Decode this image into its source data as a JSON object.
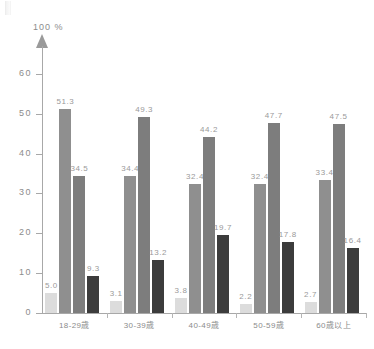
{
  "chart_data": {
    "type": "bar",
    "title": "",
    "subtitle": "",
    "xlabel": "",
    "ylabel": "",
    "axis_unit_label": "100 %",
    "ylim": [
      0,
      67
    ],
    "yticks": [
      0,
      10,
      20,
      30,
      40,
      50,
      60
    ],
    "ytick_labels": [
      "0",
      "10",
      "20",
      "30",
      "40",
      "50",
      "60"
    ],
    "grid": false,
    "legend": "none",
    "categories": [
      "18-29歳",
      "30-39歳",
      "40-49歳",
      "50-59歳",
      "60歳以上"
    ],
    "series": [
      {
        "name": "series-1",
        "color": "#dcdcdc",
        "values": [
          5.0,
          3.1,
          3.8,
          2.2,
          2.7
        ],
        "labels": [
          "5.0",
          "3.1",
          "3.8",
          "2.2",
          "2.7"
        ]
      },
      {
        "name": "series-2",
        "color": "#8f8f8f",
        "values": [
          51.3,
          34.4,
          32.4,
          32.4,
          33.4
        ],
        "labels": [
          "51.3",
          "34.4",
          "32.4",
          "32.4",
          "33.4"
        ]
      },
      {
        "name": "series-3",
        "color": "#7d7d7d",
        "values": [
          34.5,
          49.3,
          44.2,
          47.7,
          47.5
        ],
        "labels": [
          "34.5",
          "49.3",
          "44.2",
          "47.7",
          "47.5"
        ]
      },
      {
        "name": "series-4",
        "color": "#3c3c3c",
        "values": [
          9.3,
          13.2,
          19.7,
          17.8,
          16.4
        ],
        "labels": [
          "9.3",
          "13.2",
          "19.7",
          "17.8",
          "16.4"
        ]
      }
    ]
  }
}
